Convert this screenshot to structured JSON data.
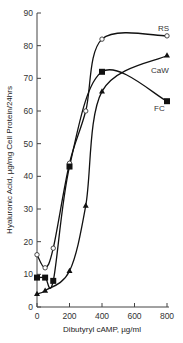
{
  "chart_data": {
    "type": "line",
    "title": "",
    "xlabel": "Dibutyryl cAMP, µg/ml",
    "ylabel": "Hyaluronic Acid, µg/mg Cell Protein/24hrs",
    "xlim": [
      0,
      800
    ],
    "ylim": [
      0,
      90
    ],
    "xticks": [
      0,
      200,
      400,
      600,
      800
    ],
    "yticks": [
      0,
      10,
      20,
      30,
      40,
      50,
      60,
      70,
      80,
      90
    ],
    "grid": false,
    "legend_position": "inline-right",
    "series": [
      {
        "name": "RS",
        "marker": "open-circle",
        "x": [
          0,
          50,
          100,
          200,
          300,
          400,
          800
        ],
        "values": [
          16,
          12,
          18,
          44,
          60,
          82,
          83
        ]
      },
      {
        "name": "CaW",
        "marker": "filled-triangle",
        "x": [
          0,
          50,
          200,
          300,
          400,
          800
        ],
        "values": [
          4,
          5,
          11,
          31,
          66,
          77
        ]
      },
      {
        "name": "FC",
        "marker": "filled-square",
        "x": [
          0,
          50,
          100,
          200,
          400,
          800
        ],
        "values": [
          9,
          9,
          8,
          43,
          72,
          63
        ]
      }
    ]
  },
  "labels": {
    "xlabel": "Dibutyryl cAMP, µg/ml",
    "ylabel": "Hyaluronic Acid, µg/mg Cell Protein/24hrs",
    "series_rs": "RS",
    "series_caw": "CaW",
    "series_fc": "FC"
  }
}
